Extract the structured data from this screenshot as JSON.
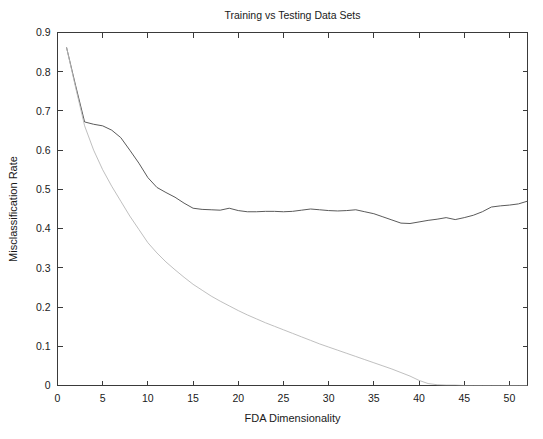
{
  "chart_data": {
    "type": "line",
    "title": "Training vs Testing Data Sets",
    "xlabel": "FDA Dimensionality",
    "ylabel": "Misclassification Rate",
    "xlim": [
      0,
      52
    ],
    "ylim": [
      0,
      0.9
    ],
    "grid": false,
    "legend": "none",
    "xticks": [
      "0",
      "5",
      "10",
      "15",
      "20",
      "25",
      "30",
      "35",
      "40",
      "45",
      "50"
    ],
    "xtick_values": [
      0,
      5,
      10,
      15,
      20,
      25,
      30,
      35,
      40,
      45,
      50
    ],
    "yticks": [
      "0",
      "0.1",
      "0.2",
      "0.3",
      "0.4",
      "0.5",
      "0.6",
      "0.7",
      "0.8",
      "0.9"
    ],
    "ytick_values": [
      0,
      0.1,
      0.2,
      0.3,
      0.4,
      0.5,
      0.6,
      0.7,
      0.8,
      0.9
    ],
    "x": [
      1,
      2,
      3,
      4,
      5,
      6,
      7,
      8,
      9,
      10,
      11,
      12,
      13,
      14,
      15,
      16,
      17,
      18,
      19,
      20,
      21,
      22,
      23,
      24,
      25,
      26,
      27,
      28,
      29,
      30,
      31,
      32,
      33,
      34,
      35,
      36,
      37,
      38,
      39,
      40,
      41,
      42,
      43,
      44,
      45,
      46,
      47,
      48,
      49,
      50,
      51,
      52
    ],
    "series": [
      {
        "name": "Testing",
        "color": "#5a5a5a",
        "width": 1.0,
        "values": [
          0.862,
          0.765,
          0.672,
          0.666,
          0.662,
          0.651,
          0.632,
          0.6,
          0.567,
          0.53,
          0.505,
          0.492,
          0.48,
          0.465,
          0.452,
          0.449,
          0.448,
          0.447,
          0.452,
          0.446,
          0.443,
          0.443,
          0.444,
          0.444,
          0.443,
          0.444,
          0.447,
          0.45,
          0.448,
          0.446,
          0.445,
          0.446,
          0.448,
          0.443,
          0.438,
          0.43,
          0.422,
          0.414,
          0.413,
          0.417,
          0.421,
          0.424,
          0.428,
          0.423,
          0.428,
          0.434,
          0.443,
          0.455,
          0.458,
          0.46,
          0.463,
          0.47
        ]
      },
      {
        "name": "Training",
        "color": "#b8b8b8",
        "width": 0.9,
        "values": [
          0.862,
          0.76,
          0.662,
          0.6,
          0.55,
          0.508,
          0.47,
          0.432,
          0.398,
          0.364,
          0.338,
          0.315,
          0.295,
          0.276,
          0.258,
          0.243,
          0.228,
          0.215,
          0.203,
          0.191,
          0.18,
          0.17,
          0.16,
          0.151,
          0.142,
          0.133,
          0.124,
          0.115,
          0.106,
          0.098,
          0.09,
          0.082,
          0.074,
          0.066,
          0.058,
          0.05,
          0.042,
          0.033,
          0.024,
          0.013,
          0.005,
          0.002,
          0.001,
          0.001,
          0.0,
          0.0,
          0.0,
          0.0,
          0.0,
          0.0,
          0.0,
          0.0
        ]
      }
    ]
  },
  "figure": {
    "background": "#ffffff",
    "axis_color": "#3a3a3a"
  }
}
